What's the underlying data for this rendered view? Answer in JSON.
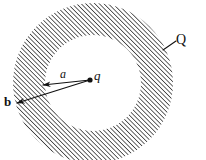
{
  "figure": {
    "background_color": "#ffffff",
    "ink_color": "#1a1a1a",
    "hatch_color": "#3a3a3a",
    "geometry": {
      "center_x": 93,
      "center_y": 83,
      "outer_radius": 80,
      "inner_radius": 48,
      "hatch_angle_deg": 45,
      "hatch_spacing_px": 3.2
    },
    "charge_point": {
      "x": 90,
      "y": 80,
      "radius": 2.6
    },
    "arrows": [
      {
        "name": "inner-radius-arrow",
        "label": "a",
        "from_x": 90,
        "from_y": 80,
        "to_x": 43,
        "to_y": 85
      },
      {
        "name": "outer-radius-arrow",
        "label": "b",
        "from_x": 90,
        "from_y": 80,
        "to_x": 17,
        "to_y": 103
      }
    ],
    "leader_line": {
      "name": "shell-leader-line",
      "from_x": 163,
      "from_y": 50,
      "to_x": 176,
      "to_y": 41
    }
  },
  "labels": {
    "shell_charge": "Q",
    "point_charge": "q",
    "inner_radius": "a",
    "outer_radius": "b"
  }
}
